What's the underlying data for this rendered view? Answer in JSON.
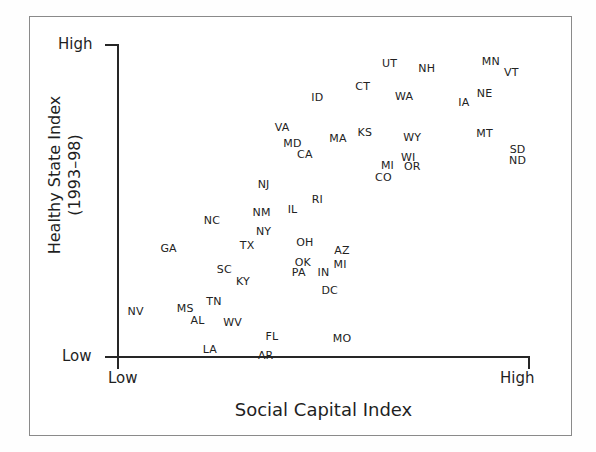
{
  "axes": {
    "x_title": "Social Capital Index",
    "x_low": "Low",
    "x_high": "High",
    "y_title_line1": "Healthy State Index",
    "y_title_line2": "(1993–98)",
    "y_low": "Low",
    "y_high": "High"
  },
  "chart_data": {
    "type": "scatter",
    "title": "",
    "xlabel": "Social Capital Index",
    "ylabel": "Healthy State Index (1993–98)",
    "xlim": [
      0,
      100
    ],
    "ylim": [
      0,
      100
    ],
    "xticklabels": [
      "Low",
      "High"
    ],
    "yticklabels": [
      "Low",
      "High"
    ],
    "grid": false,
    "legend": null,
    "point_label_mode": "text-only-state-abbreviation",
    "points": [
      {
        "label": "UT",
        "x": 66.0,
        "y": 94.0
      },
      {
        "label": "NH",
        "x": 75.0,
        "y": 92.5
      },
      {
        "label": "MN",
        "x": 90.5,
        "y": 94.5
      },
      {
        "label": "VT",
        "x": 95.5,
        "y": 91.0
      },
      {
        "label": "CT",
        "x": 59.5,
        "y": 86.5
      },
      {
        "label": "ID",
        "x": 48.5,
        "y": 83.0
      },
      {
        "label": "WA",
        "x": 69.5,
        "y": 83.5
      },
      {
        "label": "IA",
        "x": 84.0,
        "y": 81.5
      },
      {
        "label": "NE",
        "x": 89.0,
        "y": 84.5
      },
      {
        "label": "VA",
        "x": 40.0,
        "y": 73.5
      },
      {
        "label": "KS",
        "x": 60.0,
        "y": 72.0
      },
      {
        "label": "WY",
        "x": 71.5,
        "y": 70.5
      },
      {
        "label": "MT",
        "x": 89.0,
        "y": 71.5
      },
      {
        "label": "MA",
        "x": 53.5,
        "y": 70.0
      },
      {
        "label": "MD",
        "x": 42.5,
        "y": 68.5
      },
      {
        "label": "CA",
        "x": 45.5,
        "y": 65.0
      },
      {
        "label": "WI",
        "x": 70.5,
        "y": 64.0
      },
      {
        "label": "MI",
        "x": 65.5,
        "y": 61.5
      },
      {
        "label": "OR",
        "x": 71.5,
        "y": 61.0
      },
      {
        "label": "SD",
        "x": 97.0,
        "y": 66.5
      },
      {
        "label": "ND",
        "x": 97.0,
        "y": 63.0
      },
      {
        "label": "CO",
        "x": 64.5,
        "y": 57.5
      },
      {
        "label": "NJ",
        "x": 35.5,
        "y": 55.5
      },
      {
        "label": "RI",
        "x": 48.5,
        "y": 50.5
      },
      {
        "label": "IL",
        "x": 42.5,
        "y": 47.5
      },
      {
        "label": "NM",
        "x": 35.0,
        "y": 46.5
      },
      {
        "label": "NC",
        "x": 23.0,
        "y": 44.0
      },
      {
        "label": "NY",
        "x": 35.5,
        "y": 40.5
      },
      {
        "label": "TX",
        "x": 31.5,
        "y": 36.0
      },
      {
        "label": "OH",
        "x": 45.5,
        "y": 37.0
      },
      {
        "label": "AZ",
        "x": 54.5,
        "y": 34.5
      },
      {
        "label": "GA",
        "x": 12.5,
        "y": 35.0
      },
      {
        "label": "MI2",
        "x": 54.0,
        "y": 30.0
      },
      {
        "label": "OK",
        "x": 45.0,
        "y": 30.5
      },
      {
        "label": "PA",
        "x": 44.0,
        "y": 27.5
      },
      {
        "label": "IN",
        "x": 50.0,
        "y": 27.5
      },
      {
        "label": "SC",
        "x": 26.0,
        "y": 28.5
      },
      {
        "label": "KY",
        "x": 30.5,
        "y": 24.5
      },
      {
        "label": "DC",
        "x": 51.5,
        "y": 21.5
      },
      {
        "label": "TN",
        "x": 23.5,
        "y": 18.0
      },
      {
        "label": "MS",
        "x": 16.5,
        "y": 16.0
      },
      {
        "label": "NV",
        "x": 4.5,
        "y": 15.0
      },
      {
        "label": "AL",
        "x": 19.5,
        "y": 12.0
      },
      {
        "label": "WV",
        "x": 28.0,
        "y": 11.5
      },
      {
        "label": "FL",
        "x": 37.5,
        "y": 7.0
      },
      {
        "label": "MO",
        "x": 54.5,
        "y": 6.5
      },
      {
        "label": "LA",
        "x": 22.5,
        "y": 3.0
      },
      {
        "label": "AR",
        "x": 36.0,
        "y": 1.0
      }
    ],
    "display_labels": {
      "MI2": "MI"
    }
  }
}
